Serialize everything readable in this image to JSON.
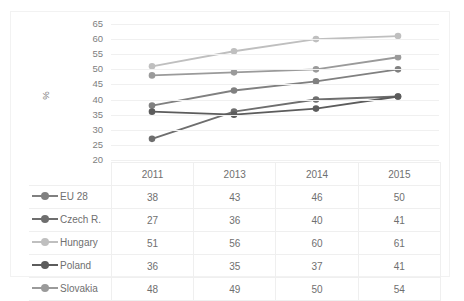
{
  "chart_data": {
    "type": "line",
    "title": "",
    "subtitle": "",
    "xlabel": "",
    "ylabel": "%",
    "ylim": [
      20,
      65
    ],
    "ytick_step": 5,
    "yticks": [
      65,
      60,
      55,
      50,
      45,
      40,
      35,
      30,
      25,
      20
    ],
    "grid": true,
    "legend_position": "table-left",
    "categories": [
      "2011",
      "2013",
      "2014",
      "2015"
    ],
    "series": [
      {
        "name": "EU 28",
        "values": [
          38,
          43,
          46,
          50
        ],
        "color": "#808080"
      },
      {
        "name": "Czech R.",
        "values": [
          27,
          36,
          40,
          41
        ],
        "color": "#6e6e6e"
      },
      {
        "name": "Hungary",
        "values": [
          51,
          56,
          60,
          61
        ],
        "color": "#bfbfbf"
      },
      {
        "name": "Poland",
        "values": [
          36,
          35,
          37,
          41
        ],
        "color": "#5c5c5c"
      },
      {
        "name": "Slovakia",
        "values": [
          48,
          49,
          50,
          54
        ],
        "color": "#9a9a9a"
      }
    ]
  },
  "table": {
    "corner_label": "",
    "column_headers": [
      "2011",
      "2013",
      "2014",
      "2015"
    ],
    "rows": [
      {
        "label": "EU 28",
        "values": [
          "38",
          "43",
          "46",
          "50"
        ]
      },
      {
        "label": "Czech R.",
        "values": [
          "27",
          "36",
          "40",
          "41"
        ]
      },
      {
        "label": "Hungary",
        "values": [
          "51",
          "56",
          "60",
          "61"
        ]
      },
      {
        "label": "Poland",
        "values": [
          "36",
          "35",
          "37",
          "41"
        ]
      },
      {
        "label": "Slovakia",
        "values": [
          "48",
          "49",
          "50",
          "54"
        ]
      }
    ]
  },
  "colors": {
    "gridline": "#f0f0f0",
    "border": "#efefef",
    "text": "#6f6f6f",
    "background": "#ffffff"
  }
}
